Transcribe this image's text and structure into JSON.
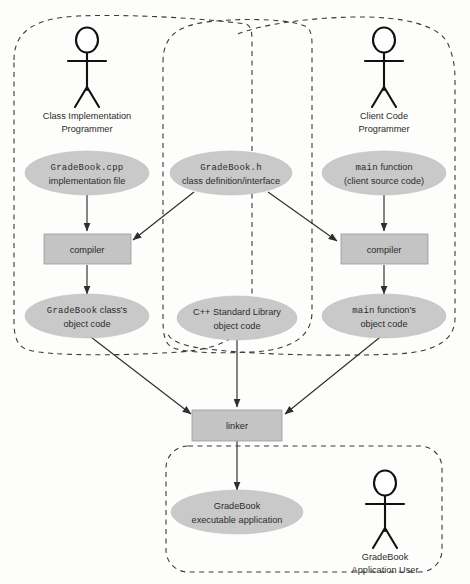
{
  "diagram": {
    "colors": {
      "node_fill": "#c9c9c9",
      "box_fill": "#c4c4c4",
      "line": "#2e2e2e",
      "boundary": "#3a3a3a",
      "text": "#2b2b2b",
      "background": "#fdfdfc"
    }
  },
  "actors": [
    {
      "id": "class-implementation-programmer",
      "line1": "Class Implementation",
      "line2": "Programmer"
    },
    {
      "id": "client-code-programmer",
      "line1": "Client Code",
      "line2": "Programmer"
    },
    {
      "id": "gradebook-application-user",
      "line1": "GradeBook",
      "line2": "Application User"
    }
  ],
  "nodes": [
    {
      "id": "gradebook-cpp",
      "line1_mono": "GradeBook.cpp",
      "line2": "implementation file"
    },
    {
      "id": "gradebook-h",
      "line1_mono": "GradeBook.h",
      "line2": "class definition/interface"
    },
    {
      "id": "main-function-source",
      "line1_mono": "main",
      "line1_sans": " function",
      "line2": "(client source code)"
    },
    {
      "id": "gradebook-object-code",
      "line1_mono": "GradeBook",
      "line1_sans": " class's",
      "line2": "object code"
    },
    {
      "id": "cpp-standard-library-object-code",
      "line1": "C++ Standard Library",
      "line2": "object code"
    },
    {
      "id": "main-function-object-code",
      "line1_mono": "main",
      "line1_sans": " function's",
      "line2": "object code"
    },
    {
      "id": "gradebook-executable",
      "line1": "GradeBook",
      "line2": "executable application"
    }
  ],
  "processes": [
    {
      "id": "compiler-left",
      "label": "compiler"
    },
    {
      "id": "compiler-right",
      "label": "compiler"
    },
    {
      "id": "linker",
      "label": "linker"
    }
  ]
}
